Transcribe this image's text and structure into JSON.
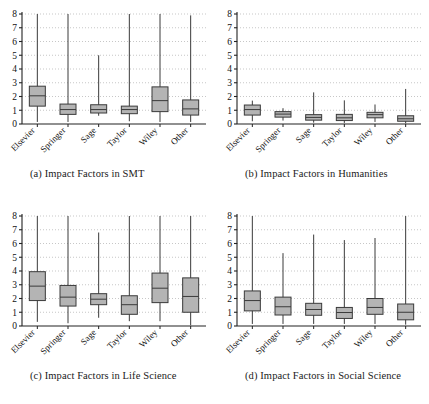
{
  "figure": {
    "panel_labels": [
      "(a)",
      "(b)",
      "(c)",
      "(d)"
    ]
  },
  "axis": {
    "yticks": [
      "0",
      "1",
      "2",
      "3",
      "4",
      "5",
      "6",
      "7",
      "8"
    ],
    "ylim": [
      0,
      8
    ],
    "categories": [
      "Elsevier",
      "Springer",
      "Sage",
      "Taylor",
      "Wiley",
      "Other"
    ]
  },
  "style": {
    "box_fill": "#b4b4b4",
    "box_stroke": "#3a3a3a",
    "axis_color": "#222222",
    "grid_color": "#b9b9b9",
    "background": "#ffffff"
  },
  "chart_data": [
    {
      "type": "box",
      "title": "(a) Impact Factors in SMT",
      "caption": "(a) Impact Factors in SMT",
      "xlabel": "",
      "ylabel": "",
      "ylim": [
        0,
        8
      ],
      "yticks": [
        0,
        1,
        2,
        3,
        4,
        5,
        6,
        7,
        8
      ],
      "grid": true,
      "legend": "none",
      "categories": [
        "Elsevier",
        "Springer",
        "Sage",
        "Taylor",
        "Wiley",
        "Other"
      ],
      "boxes": [
        {
          "name": "Elsevier",
          "whisker_low": 0.15,
          "q1": 1.3,
          "median": 2.05,
          "q3": 2.75,
          "whisker_high": 8.0
        },
        {
          "name": "Springer",
          "whisker_low": 0.15,
          "q1": 0.7,
          "median": 1.05,
          "q3": 1.45,
          "whisker_high": 8.0
        },
        {
          "name": "Sage",
          "whisker_low": 0.6,
          "q1": 0.8,
          "median": 1.05,
          "q3": 1.4,
          "whisker_high": 5.0
        },
        {
          "name": "Taylor",
          "whisker_low": 0.2,
          "q1": 0.75,
          "median": 1.05,
          "q3": 1.3,
          "whisker_high": 8.0
        },
        {
          "name": "Wiley",
          "whisker_low": 0.15,
          "q1": 0.9,
          "median": 1.7,
          "q3": 2.7,
          "whisker_high": 8.0
        },
        {
          "name": "Other",
          "whisker_low": 0.15,
          "q1": 0.65,
          "median": 1.1,
          "q3": 1.75,
          "whisker_high": 7.9
        }
      ]
    },
    {
      "type": "box",
      "title": "(b) Impact Factors in Humanities",
      "caption": "(b) Impact Factors in Humanities",
      "xlabel": "",
      "ylabel": "",
      "ylim": [
        0,
        8
      ],
      "yticks": [
        0,
        1,
        2,
        3,
        4,
        5,
        6,
        7,
        8
      ],
      "grid": true,
      "legend": "none",
      "categories": [
        "Elsevier",
        "Springer",
        "Sage",
        "Taylor",
        "Wiley",
        "Other"
      ],
      "boxes": [
        {
          "name": "Elsevier",
          "whisker_low": 0.2,
          "q1": 0.65,
          "median": 1.05,
          "q3": 1.38,
          "whisker_high": 1.7
        },
        {
          "name": "Springer",
          "whisker_low": 0.25,
          "q1": 0.5,
          "median": 0.72,
          "q3": 0.9,
          "whisker_high": 1.15
        },
        {
          "name": "Sage",
          "whisker_low": 0.1,
          "q1": 0.28,
          "median": 0.48,
          "q3": 0.68,
          "whisker_high": 2.3
        },
        {
          "name": "Taylor",
          "whisker_low": 0.08,
          "q1": 0.25,
          "median": 0.45,
          "q3": 0.7,
          "whisker_high": 1.72
        },
        {
          "name": "Wiley",
          "whisker_low": 0.15,
          "q1": 0.45,
          "median": 0.68,
          "q3": 0.85,
          "whisker_high": 1.42
        },
        {
          "name": "Other",
          "whisker_low": 0.05,
          "q1": 0.2,
          "median": 0.38,
          "q3": 0.6,
          "whisker_high": 2.55
        }
      ]
    },
    {
      "type": "box",
      "title": "(c) Impact Factors in Life Science",
      "caption": "(c) Impact Factors in Life Science",
      "xlabel": "",
      "ylabel": "",
      "ylim": [
        0,
        8
      ],
      "yticks": [
        0,
        1,
        2,
        3,
        4,
        5,
        6,
        7,
        8
      ],
      "grid": true,
      "legend": "none",
      "categories": [
        "Elsevier",
        "Springer",
        "Sage",
        "Taylor",
        "Wiley",
        "Other"
      ],
      "boxes": [
        {
          "name": "Elsevier",
          "whisker_low": 0.3,
          "q1": 1.85,
          "median": 2.9,
          "q3": 3.95,
          "whisker_high": 8.0
        },
        {
          "name": "Springer",
          "whisker_low": 0.2,
          "q1": 1.45,
          "median": 2.1,
          "q3": 2.95,
          "whisker_high": 8.0
        },
        {
          "name": "Sage",
          "whisker_low": 0.6,
          "q1": 1.55,
          "median": 1.95,
          "q3": 2.35,
          "whisker_high": 6.8
        },
        {
          "name": "Taylor",
          "whisker_low": 0.35,
          "q1": 0.85,
          "median": 1.55,
          "q3": 2.2,
          "whisker_high": 8.0
        },
        {
          "name": "Wiley",
          "whisker_low": 0.35,
          "q1": 1.7,
          "median": 2.75,
          "q3": 3.85,
          "whisker_high": 8.0
        },
        {
          "name": "Other",
          "whisker_low": 0.05,
          "q1": 1.0,
          "median": 2.15,
          "q3": 3.5,
          "whisker_high": 8.0
        }
      ]
    },
    {
      "type": "box",
      "title": "(d) Impact Factors in Social Science",
      "caption": "(d) Impact Factors in Social Science",
      "xlabel": "",
      "ylabel": "",
      "ylim": [
        0,
        8
      ],
      "yticks": [
        0,
        1,
        2,
        3,
        4,
        5,
        6,
        7,
        8
      ],
      "grid": true,
      "legend": "none",
      "categories": [
        "Elsevier",
        "Springer",
        "Sage",
        "Taylor",
        "Wiley",
        "Other"
      ],
      "boxes": [
        {
          "name": "Elsevier",
          "whisker_low": 0.15,
          "q1": 1.1,
          "median": 1.85,
          "q3": 2.55,
          "whisker_high": 8.0
        },
        {
          "name": "Springer",
          "whisker_low": 0.15,
          "q1": 0.8,
          "median": 1.4,
          "q3": 2.1,
          "whisker_high": 5.3
        },
        {
          "name": "Sage",
          "whisker_low": 0.15,
          "q1": 0.78,
          "median": 1.2,
          "q3": 1.65,
          "whisker_high": 6.65
        },
        {
          "name": "Taylor",
          "whisker_low": 0.15,
          "q1": 0.55,
          "median": 0.98,
          "q3": 1.35,
          "whisker_high": 6.25
        },
        {
          "name": "Wiley",
          "whisker_low": 0.15,
          "q1": 0.85,
          "median": 1.35,
          "q3": 2.0,
          "whisker_high": 6.4
        },
        {
          "name": "Other",
          "whisker_low": 0.1,
          "q1": 0.45,
          "median": 1.0,
          "q3": 1.6,
          "whisker_high": 8.0
        }
      ]
    }
  ]
}
